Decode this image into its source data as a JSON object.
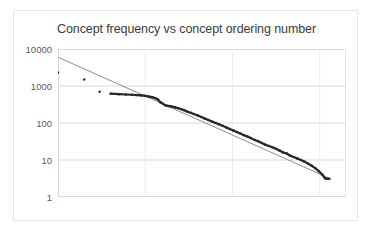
{
  "chart_data": {
    "type": "scatter",
    "title": "Concept frequency vs concept ordering number",
    "xlabel": "",
    "ylabel": "",
    "xscale": "log",
    "yscale": "log",
    "xlim": [
      1,
      2000
    ],
    "ylim": [
      1,
      10000
    ],
    "xticks": [
      "1",
      "10",
      "100",
      "1000"
    ],
    "xtick_values": [
      1,
      10,
      100,
      1000
    ],
    "yticks": [
      "1",
      "10",
      "100",
      "1000",
      "10000"
    ],
    "ytick_values": [
      1,
      10,
      100,
      1000,
      10000
    ],
    "grid": true,
    "legend": "none",
    "marker_color": "#262626",
    "trendline_color": "#808080",
    "gridline_color": "#d9d9d9",
    "series": [
      {
        "name": "Concept frequency",
        "type": "scatter",
        "x": [
          1,
          2,
          3,
          4,
          5,
          6,
          7,
          8,
          9,
          10,
          11,
          12,
          13,
          14,
          15,
          16,
          17,
          18,
          19,
          20,
          22,
          24,
          26,
          28,
          30,
          33,
          36,
          40,
          44,
          48,
          53,
          58,
          64,
          70,
          77,
          85,
          93,
          102,
          112,
          123,
          135,
          148,
          163,
          179,
          197,
          216,
          237,
          261,
          287,
          315,
          346,
          380,
          418,
          459,
          504,
          554,
          609,
          669,
          735,
          808,
          888,
          976,
          1072,
          1150,
          1220,
          1290
        ],
        "y": [
          2300,
          1500,
          700,
          620,
          600,
          590,
          580,
          570,
          555,
          540,
          520,
          500,
          470,
          430,
          360,
          330,
          300,
          290,
          285,
          280,
          265,
          250,
          235,
          220,
          205,
          190,
          175,
          160,
          145,
          132,
          120,
          110,
          100,
          92,
          84,
          76,
          69,
          63,
          57,
          52,
          47,
          43,
          39,
          35,
          32,
          29,
          26,
          24,
          22,
          20,
          18,
          16,
          15,
          13,
          12,
          11,
          10,
          9,
          8,
          7,
          6,
          5,
          4,
          3.2,
          3.1,
          3.1
        ]
      },
      {
        "name": "Power-law trend line",
        "type": "line",
        "x": [
          1,
          1290
        ],
        "y": [
          6000,
          3.2
        ]
      }
    ]
  }
}
